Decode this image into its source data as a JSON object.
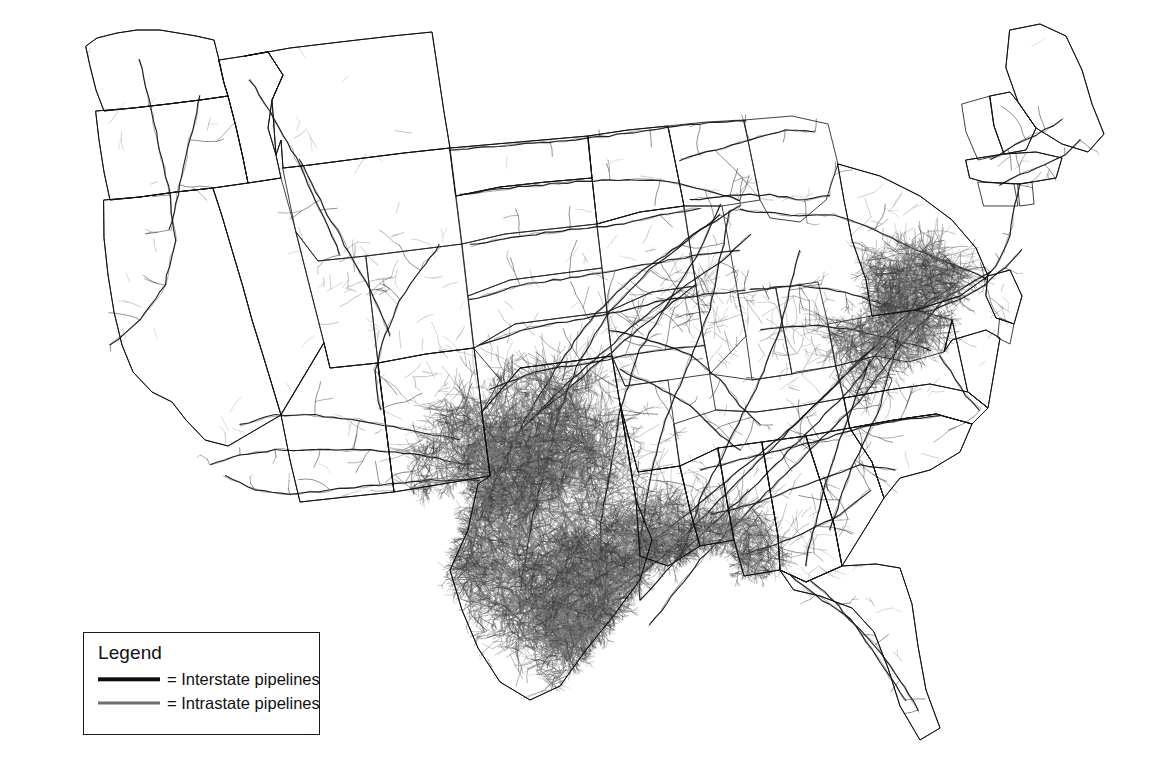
{
  "map": {
    "title": "",
    "subject": "United States natural gas pipeline network",
    "background_color": "#ffffff",
    "border_color": "#1a1a1a",
    "interstate_color": "#0d0d0d",
    "intrastate_color": "#6f6f6f",
    "state_outline_color": "#202020"
  },
  "legend": {
    "title": "Legend",
    "box_border_color": "#1a1a1a",
    "items": [
      {
        "equals": "=",
        "label": "Interstate pipelines",
        "color": "#0d0d0d",
        "style": "solid-dark"
      },
      {
        "equals": "=",
        "label": "Intrastate pipelines",
        "color": "#6f6f6f",
        "style": "solid-gray"
      }
    ]
  },
  "density_regions": [
    {
      "name": "gulf-coast-texas-louisiana",
      "level": "very-high"
    },
    {
      "name": "kansas-oklahoma-panhandle",
      "level": "very-high"
    },
    {
      "name": "appalachia-pennsylvania-ohio",
      "level": "high"
    },
    {
      "name": "permian-west-texas",
      "level": "high"
    },
    {
      "name": "midwest-illinois-indiana",
      "level": "medium"
    },
    {
      "name": "rocky-mountain",
      "level": "low"
    },
    {
      "name": "pacific-northwest",
      "level": "low"
    },
    {
      "name": "florida-peninsula",
      "level": "low"
    }
  ]
}
